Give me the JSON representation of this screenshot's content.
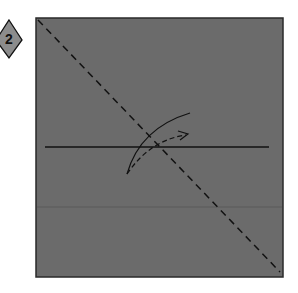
{
  "diagram": {
    "type": "origami-fold-step",
    "step_badge": {
      "label": "2",
      "shape": "diamond",
      "fill": "#8c8c8c"
    },
    "paper": {
      "fill": "#6b6b6b",
      "border": "#2a2a2a"
    },
    "lines": {
      "diagonal_fold": "valley-fold-dashed",
      "horizontal_crease": "existing-crease",
      "faint_crease": "faint-crease"
    },
    "arrow": {
      "meaning": "fold-direction-arrow"
    }
  }
}
